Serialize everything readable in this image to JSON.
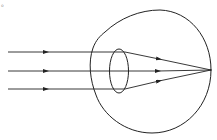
{
  "diagram": {
    "title": "",
    "corner_mark": "。",
    "colors": {
      "stroke": "#222222",
      "background": "#ffffff"
    },
    "eye": {
      "globe_center": [
        151,
        71
      ],
      "globe_radius": 61,
      "lens_center": [
        119,
        71
      ],
      "lens_rx": 9,
      "lens_ry": 22
    },
    "rays": [
      {
        "y": 52,
        "start_x": 8,
        "lens_x": 124,
        "focus": [
          211,
          70
        ]
      },
      {
        "y": 71,
        "start_x": 8,
        "lens_x": 124,
        "focus": [
          211,
          70
        ]
      },
      {
        "y": 89,
        "start_x": 8,
        "lens_x": 124,
        "focus": [
          211,
          70
        ]
      }
    ],
    "focus_point": [
      211,
      70
    ]
  }
}
